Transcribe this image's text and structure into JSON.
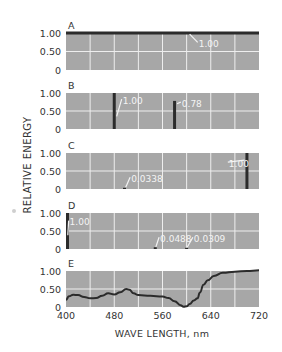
{
  "chart_data": {
    "type": "bar",
    "title": "",
    "ylabel": "RELATIVE ENERGY",
    "xlabel": "WAVE LENGTH, nm",
    "xlim": [
      400,
      720
    ],
    "x_ticks": [
      400,
      480,
      560,
      640,
      720
    ],
    "x_tick_labels": [
      "400",
      "480",
      "560",
      "640",
      "720"
    ],
    "grid": true,
    "grid_x_step": 40,
    "panels": [
      {
        "label": "A",
        "type": "line",
        "ylim": [
          0,
          1
        ],
        "y_tick_labels": [
          "1.00",
          "0.50",
          "0"
        ],
        "series": [
          {
            "name": "equal energy",
            "x": [
              400,
              720
            ],
            "values": [
              1.0,
              1.0
            ]
          }
        ],
        "annotations": [
          {
            "text": "1.00",
            "x": 620,
            "y": 0.72,
            "target_x": 605,
            "target_y": 0.97
          }
        ]
      },
      {
        "label": "B",
        "type": "bar",
        "ylim": [
          0,
          1
        ],
        "y_tick_labels": [
          "1.00",
          "0.50",
          "0"
        ],
        "lines": [
          {
            "x": 480,
            "value": 1.0
          },
          {
            "x": 580,
            "value": 0.78
          }
        ],
        "annotations": [
          {
            "text": "1.00",
            "x": 494,
            "y": 0.8,
            "target_x": 484,
            "target_y": 0.35
          },
          {
            "text": "0.78",
            "x": 592,
            "y": 0.72,
            "target_x": 584,
            "target_y": 0.7
          }
        ]
      },
      {
        "label": "C",
        "type": "bar",
        "ylim": [
          0,
          1
        ],
        "y_tick_labels": [
          "1.00",
          "0.50",
          "0"
        ],
        "lines": [
          {
            "x": 497,
            "value": 0.0338
          },
          {
            "x": 700,
            "value": 1.0
          }
        ],
        "annotations": [
          {
            "text": "0.0338",
            "x": 508,
            "y": 0.3,
            "target_x": 499,
            "target_y": 0.05
          },
          {
            "text": "1.00",
            "x": 670,
            "y": 0.72,
            "target_x": 696,
            "target_y": 0.8
          }
        ]
      },
      {
        "label": "D",
        "type": "bar",
        "ylim": [
          0,
          1
        ],
        "y_tick_labels": [
          "1.00",
          "0.50",
          "0"
        ],
        "lines": [
          {
            "x": 401,
            "value": 1.0
          },
          {
            "x": 548,
            "value": 0.0488
          },
          {
            "x": 600,
            "value": 0.0309
          }
        ],
        "annotations": [
          {
            "text": "1.00",
            "x": 406,
            "y": 0.76,
            "target_x": 403,
            "target_y": 0.38
          },
          {
            "text": "0.0488",
            "x": 556,
            "y": 0.3,
            "target_x": 549,
            "target_y": 0.06
          },
          {
            "text": "0.0309",
            "x": 612,
            "y": 0.3,
            "target_x": 601,
            "target_y": 0.05
          }
        ]
      },
      {
        "label": "E",
        "type": "line",
        "ylim": [
          0,
          1
        ],
        "y_tick_labels": [
          "1.00",
          "0.50",
          "0"
        ],
        "series": [
          {
            "name": "spectral reflectance curve",
            "x": [
              400,
              405,
              412,
              420,
              430,
              440,
              450,
              460,
              470,
              480,
              490,
              500,
              505,
              512,
              520,
              540,
              560,
              570,
              580,
              590,
              595,
              600,
              605,
              612,
              618,
              622,
              628,
              635,
              645,
              660,
              680,
              700,
              720
            ],
            "values": [
              0.2,
              0.3,
              0.34,
              0.33,
              0.28,
              0.24,
              0.25,
              0.31,
              0.38,
              0.35,
              0.41,
              0.5,
              0.48,
              0.38,
              0.33,
              0.31,
              0.29,
              0.25,
              0.16,
              0.05,
              0.01,
              0.02,
              0.08,
              0.18,
              0.24,
              0.4,
              0.62,
              0.74,
              0.86,
              0.95,
              0.98,
              1.0,
              1.02
            ]
          }
        ]
      }
    ]
  },
  "colors": {
    "panel_fill": "#a7a7a7",
    "gridline": "#eeeeee",
    "data_ink": "#2b2b2b",
    "annotation_text": "#f4f4f4",
    "axis_text": "#333333"
  }
}
